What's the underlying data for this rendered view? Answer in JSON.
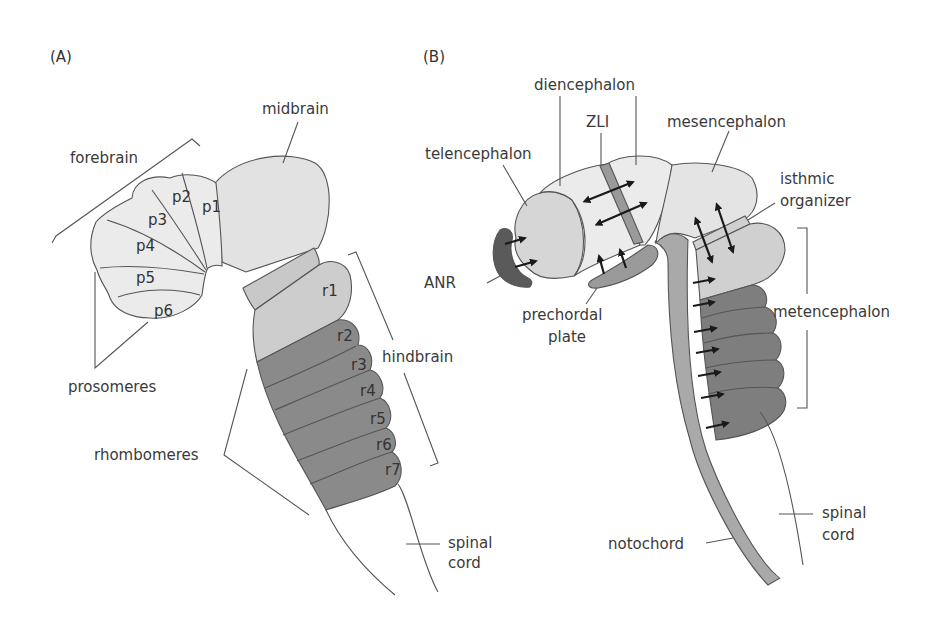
{
  "panels": {
    "a": {
      "label": "(A)",
      "regions": {
        "forebrain": "forebrain",
        "midbrain": "midbrain",
        "hindbrain": "hindbrain",
        "prosomeres": "prosomeres",
        "rhombomeres": "rhombomeres",
        "spinal_cord_line1": "spinal",
        "spinal_cord_line2": "cord"
      },
      "prosomeres": [
        "p1",
        "p2",
        "p3",
        "p4",
        "p5",
        "p6"
      ],
      "rhombomeres": [
        "r1",
        "r2",
        "r3",
        "r4",
        "r5",
        "r6",
        "r7"
      ]
    },
    "b": {
      "label": "(B)",
      "regions": {
        "diencephalon": "diencephalon",
        "zli": "ZLI",
        "mesencephalon": "mesencephalon",
        "telencephalon": "telencephalon",
        "isthmic_line1": "isthmic",
        "isthmic_line2": "organizer",
        "anr": "ANR",
        "prechordal_line1": "prechordal",
        "prechordal_line2": "plate",
        "metencephalon": "metencephalon",
        "spinal_cord_line1": "spinal",
        "spinal_cord_line2": "cord",
        "notochord": "notochord"
      }
    }
  },
  "colors": {
    "light_fill": "#ebebeb",
    "medium_fill": "#c8c8c8",
    "dark_fill": "#8a8a8a",
    "darkest_fill": "#5a5a5a",
    "outline": "#555555"
  }
}
